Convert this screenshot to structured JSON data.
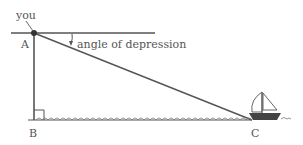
{
  "diagram": {
    "labels": {
      "you": "you",
      "point_a": "A",
      "point_b": "B",
      "point_c": "C",
      "angle": "angle of depression"
    },
    "colors": {
      "line": "#555555",
      "dot": "#333333",
      "boat_hull": "#444444",
      "background": "#ffffff"
    }
  }
}
